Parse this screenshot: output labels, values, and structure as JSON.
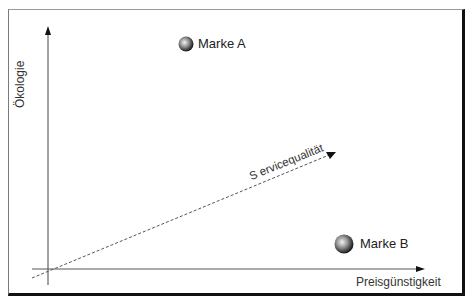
{
  "diagram": {
    "type": "positioning-map",
    "axes": {
      "y_label": "Ökologie",
      "x_label": "Preisgünstigkeit",
      "diagonal_label": "S ervicequalität"
    },
    "brands": [
      {
        "name": "Marke A",
        "x": 186,
        "y": 44
      },
      {
        "name": "Marke B",
        "x": 344,
        "y": 244
      }
    ]
  }
}
